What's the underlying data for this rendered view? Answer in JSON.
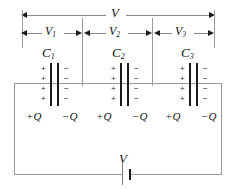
{
  "diagram": {
    "total_voltage_label": "V",
    "battery_label": "V",
    "segments": [
      {
        "voltage_label": "V",
        "voltage_sub": "1",
        "cap_label": "C",
        "cap_sub": "1",
        "pos_charge": "+Q",
        "neg_charge": "−Q"
      },
      {
        "voltage_label": "V",
        "voltage_sub": "2",
        "cap_label": "C",
        "cap_sub": "2",
        "pos_charge": "+Q",
        "neg_charge": "−Q"
      },
      {
        "voltage_label": "V",
        "voltage_sub": "3",
        "cap_label": "C",
        "cap_sub": "3",
        "pos_charge": "+Q",
        "neg_charge": "−Q"
      }
    ],
    "plus_sign": "+",
    "minus_sign": "−",
    "signs_per_plate": 4,
    "colors": {
      "wire": "#9b9b9b",
      "plate": "#1b1b1b",
      "arrow": "#1a1a1a",
      "text": "#111111",
      "background": "#ffffff"
    }
  }
}
